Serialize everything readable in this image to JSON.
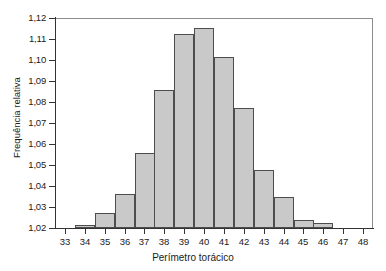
{
  "chart_data": {
    "type": "bar",
    "title": "",
    "subtitle": "",
    "xlabel": "Perímetro torácico",
    "ylabel": "Frequência relativa",
    "categories": [
      34,
      35,
      36,
      37,
      38,
      39,
      40,
      41,
      42,
      43,
      44,
      45,
      46
    ],
    "values": [
      1.0215,
      1.0272,
      1.036,
      1.0555,
      1.0855,
      1.1123,
      1.1153,
      1.1013,
      1.077,
      1.0475,
      1.0348,
      1.024,
      1.0222
    ],
    "bar_width": 1,
    "bars_centered_on_ticks": true,
    "xlim": [
      32.5,
      48.5
    ],
    "ylim": [
      1.02,
      1.12
    ],
    "x_ticks": [
      33,
      34,
      35,
      36,
      37,
      38,
      39,
      40,
      41,
      42,
      43,
      44,
      45,
      46,
      47,
      48
    ],
    "x_tick_labels": [
      "33",
      "34",
      "35",
      "36",
      "37",
      "38",
      "39",
      "40",
      "41",
      "42",
      "43",
      "44",
      "45",
      "46",
      "47",
      "48"
    ],
    "y_ticks": [
      1.02,
      1.03,
      1.04,
      1.05,
      1.06,
      1.07,
      1.08,
      1.09,
      1.1,
      1.11,
      1.12
    ],
    "y_tick_labels": [
      "1,02",
      "1,03",
      "1,04",
      "1,05",
      "1,06",
      "1,07",
      "1,08",
      "1,09",
      "1,10",
      "1,11",
      "1,12"
    ],
    "grid": false,
    "legend": null,
    "legend_position": "none",
    "decimal_separator": ",",
    "colors": {
      "bar_fill": "#c9c9c9",
      "bar_border": "#4d4d4d",
      "axis": "#333333",
      "frame": "#8d8d8d",
      "text": "#1a1a1a",
      "background": "#ffffff"
    }
  }
}
